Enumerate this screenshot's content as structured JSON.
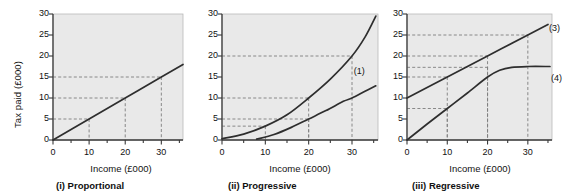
{
  "figure": {
    "axis_labels": {
      "y": "Tax paid (£000)",
      "x": "Income (£000)"
    },
    "y_ticks": [
      "0",
      "5",
      "10",
      "15",
      "20",
      "25",
      "30"
    ],
    "x_ticks": [
      "0",
      "10",
      "20",
      "30"
    ],
    "colors": {
      "plot_background": "#e9e9e9",
      "axis": "#3a3a3a",
      "curve": "#2e2e2e",
      "guide_dashed": "#7d7d7d",
      "page_background": "#ffffff"
    }
  },
  "chart_data": [
    {
      "type": "line",
      "title": "(i) Proportional",
      "xlabel": "Income (£000)",
      "ylabel": "Tax paid (£000)",
      "xlim": [
        0,
        36
      ],
      "ylim": [
        0,
        30
      ],
      "xticks": [
        0,
        10,
        20,
        30
      ],
      "yticks": [
        0,
        5,
        10,
        15,
        20,
        25,
        30
      ],
      "grid": false,
      "series": [
        {
          "name": "proportional tax",
          "label": "",
          "x": [
            0,
            10,
            20,
            30,
            36
          ],
          "values": [
            0,
            5,
            10,
            15,
            18
          ]
        }
      ],
      "guides": [
        {
          "x": 10,
          "y": 5
        },
        {
          "x": 20,
          "y": 10
        },
        {
          "x": 30,
          "y": 15
        }
      ]
    },
    {
      "type": "line",
      "title": "(ii) Progressive",
      "xlabel": "Income (£000)",
      "ylabel": "Tax paid (£000)",
      "xlim": [
        0,
        36
      ],
      "ylim": [
        0,
        30
      ],
      "xticks": [
        0,
        10,
        20,
        30
      ],
      "yticks": [
        0,
        5,
        10,
        15,
        20,
        25,
        30
      ],
      "grid": false,
      "series": [
        {
          "name": "progressive tax steeper",
          "label": "(2)",
          "x": [
            0,
            5,
            10,
            15,
            20,
            25,
            30,
            33,
            35.5
          ],
          "values": [
            0.3,
            1.4,
            3.3,
            6.0,
            10.0,
            14.5,
            20.0,
            24.5,
            29.5
          ]
        },
        {
          "name": "progressive tax shallower",
          "label": "(1)",
          "x": [
            8,
            12,
            16,
            20,
            24,
            28,
            30,
            33,
            35.5
          ],
          "values": [
            0.2,
            1.3,
            3.0,
            5.0,
            7.0,
            9.2,
            10.0,
            11.6,
            12.9
          ]
        }
      ],
      "guides": [
        {
          "x": 10,
          "y": 3.3
        },
        {
          "x": 20,
          "y": 10
        },
        {
          "x": 20,
          "y": 5
        },
        {
          "x": 30,
          "y": 20
        }
      ]
    },
    {
      "type": "line",
      "title": "(iii) Regressive",
      "xlabel": "Income (£000)",
      "ylabel": "Tax paid (£000)",
      "xlim": [
        0,
        36
      ],
      "ylim": [
        0,
        30
      ],
      "xticks": [
        0,
        10,
        20,
        30
      ],
      "yticks": [
        0,
        5,
        10,
        15,
        20,
        25,
        30
      ],
      "grid": false,
      "series": [
        {
          "name": "regressive tax line",
          "label": "(3)",
          "x": [
            0,
            10,
            20,
            30,
            35
          ],
          "values": [
            10,
            15,
            20,
            25,
            27.5
          ]
        },
        {
          "name": "regressive tax curve",
          "label": "(4)",
          "x": [
            0,
            5,
            10,
            15,
            20,
            23,
            26,
            30,
            35.5
          ],
          "values": [
            0,
            3.8,
            7.5,
            11.2,
            15.0,
            16.6,
            17.3,
            17.5,
            17.5
          ]
        }
      ],
      "guides": [
        {
          "x": 10,
          "y": 15
        },
        {
          "x": 10,
          "y": 7.5
        },
        {
          "x": 20,
          "y": 20
        },
        {
          "x": 20,
          "y": 17.3
        },
        {
          "x": 30,
          "y": 25
        }
      ]
    }
  ]
}
